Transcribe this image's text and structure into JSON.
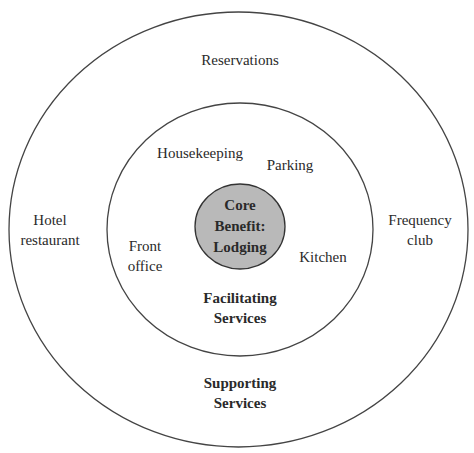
{
  "diagram": {
    "type": "concentric-service-model",
    "colors": {
      "line": "#444444",
      "core_fill": "#b9b9b9",
      "text": "#2a2a2a",
      "background": "#ffffff"
    },
    "core": {
      "line1": "Core",
      "line2": "Benefit:",
      "line3": "Lodging"
    },
    "facilitating_ring": {
      "title_line1": "Facilitating",
      "title_line2": "Services",
      "items": [
        {
          "line1": "Housekeeping"
        },
        {
          "line1": "Parking"
        },
        {
          "line1": "Front",
          "line2": "office"
        },
        {
          "line1": "Kitchen"
        }
      ]
    },
    "supporting_ring": {
      "title_line1": "Supporting",
      "title_line2": "Services",
      "items": [
        {
          "line1": "Reservations"
        },
        {
          "line1": "Hotel",
          "line2": "restaurant"
        },
        {
          "line1": "Frequency",
          "line2": "club"
        }
      ]
    }
  }
}
